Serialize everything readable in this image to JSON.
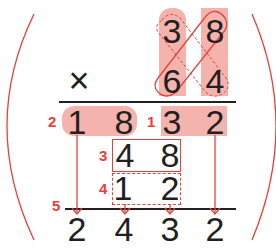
{
  "problem": {
    "multiplicand": [
      "3",
      "8"
    ],
    "multiplier": [
      "6",
      "4"
    ],
    "operator": "×",
    "partial_rows": {
      "row_tens_product": {
        "step": "2",
        "digits": [
          "1",
          "8"
        ]
      },
      "row_ones_product": {
        "step": "1",
        "digits": [
          "3",
          "2"
        ]
      },
      "row_cross_1": {
        "step": "3",
        "digits": [
          "4",
          "8"
        ]
      },
      "row_cross_2": {
        "step": "4",
        "digits": [
          "1",
          "2"
        ]
      }
    },
    "sum_step": "5",
    "result": [
      "2",
      "4",
      "3",
      "2"
    ]
  },
  "colors": {
    "accent": "#e8413b",
    "highlight": "#f4b3ad",
    "text": "#231f20",
    "rule": "#231f20"
  }
}
